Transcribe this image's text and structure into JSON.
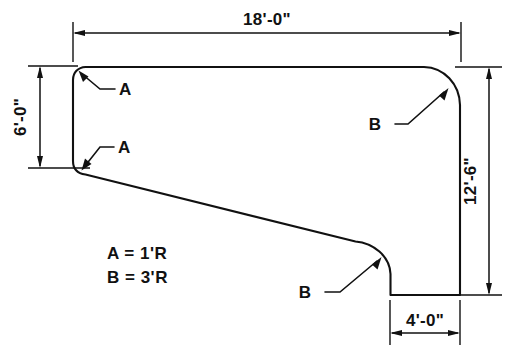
{
  "drawing": {
    "type": "engineering-dimensioned-outline",
    "units": "feet-inches",
    "dimensions": [
      {
        "id": "top",
        "label": "18'-0\"",
        "orientation": "horizontal",
        "position": "top",
        "feet": 18,
        "inches": 0
      },
      {
        "id": "left",
        "label": "6'-0\"",
        "orientation": "vertical",
        "position": "left",
        "feet": 6,
        "inches": 0
      },
      {
        "id": "right",
        "label": "12'-6\"",
        "orientation": "vertical",
        "position": "right",
        "feet": 12,
        "inches": 6
      },
      {
        "id": "bottom",
        "label": "4'-0\"",
        "orientation": "horizontal",
        "position": "bottom",
        "feet": 4,
        "inches": 0
      }
    ],
    "notes": [
      {
        "id": "note-a",
        "label": "A = 1'R"
      },
      {
        "id": "note-b",
        "label": "B = 3'R"
      }
    ],
    "callouts": [
      {
        "id": "callout-a-top",
        "label": "A",
        "target": "upper-left-fillet"
      },
      {
        "id": "callout-a-middle",
        "label": "A",
        "target": "lower-left-fillet"
      },
      {
        "id": "callout-b-top",
        "label": "B",
        "target": "upper-right-radius"
      },
      {
        "id": "callout-b-bottom",
        "label": "B",
        "target": "lower-right-radius"
      }
    ],
    "radii": {
      "a_label": "A",
      "a_value": "1'R",
      "b_label": "B",
      "b_value": "3'R"
    },
    "colors": {
      "line": "#111111",
      "background": "#ffffff"
    }
  }
}
